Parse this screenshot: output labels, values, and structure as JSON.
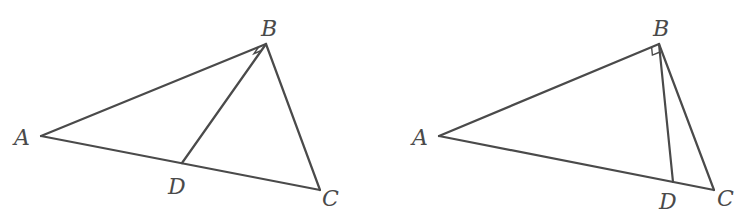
{
  "figures": [
    {
      "id": "left",
      "description": "Triangle ABC with point D on AC; angle ABD is a right angle",
      "labels": {
        "A": "A",
        "B": "B",
        "C": "C",
        "D": "D"
      },
      "points": {
        "A": [
          41,
          136
        ],
        "B": [
          266,
          44
        ],
        "C": [
          320,
          190
        ],
        "D": [
          182,
          163
        ]
      },
      "right_angle_at": "B",
      "right_angle_between": [
        "BA",
        "BD"
      ]
    },
    {
      "id": "right",
      "description": "Triangle ABC with point D on AC close to C; angle ABD is a right angle",
      "labels": {
        "A": "A",
        "B": "B",
        "C": "C",
        "D": "D"
      },
      "points": {
        "A": [
          439,
          136
        ],
        "B": [
          659,
          44
        ],
        "C": [
          714,
          190
        ],
        "D": [
          673,
          182
        ]
      },
      "right_angle_at": "B",
      "right_angle_between": [
        "BA",
        "BD"
      ]
    }
  ],
  "colors": {
    "stroke": "#4a4a4a",
    "background": "#ffffff"
  }
}
